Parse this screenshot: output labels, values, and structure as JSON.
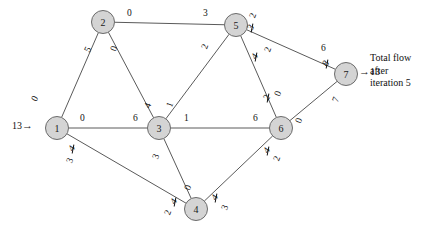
{
  "figure": {
    "type": "max-flow-network",
    "caption_lines": [
      "Total flow",
      "after",
      "iteration 5"
    ],
    "source_inflow": "13",
    "sink_outflow": "13",
    "source_arrow": "→",
    "sink_arrow": "→"
  },
  "nodes": [
    {
      "id": "1",
      "label": "1",
      "x": 57,
      "y": 128
    },
    {
      "id": "2",
      "label": "2",
      "x": 103,
      "y": 22
    },
    {
      "id": "3",
      "label": "3",
      "x": 159,
      "y": 128
    },
    {
      "id": "4",
      "label": "4",
      "x": 196,
      "y": 209
    },
    {
      "id": "5",
      "label": "5",
      "x": 236,
      "y": 25
    },
    {
      "id": "6",
      "label": "6",
      "x": 281,
      "y": 128
    },
    {
      "id": "7",
      "label": "7",
      "x": 346,
      "y": 74
    }
  ],
  "edges": [
    {
      "from": "1",
      "to": "2",
      "name": "edge-1-2"
    },
    {
      "from": "1",
      "to": "3",
      "name": "edge-1-3"
    },
    {
      "from": "1",
      "to": "4",
      "name": "edge-1-4"
    },
    {
      "from": "2",
      "to": "5",
      "name": "edge-2-5"
    },
    {
      "from": "2",
      "to": "3",
      "name": "edge-2-3"
    },
    {
      "from": "3",
      "to": "5",
      "name": "edge-3-5"
    },
    {
      "from": "3",
      "to": "6",
      "name": "edge-3-6"
    },
    {
      "from": "3",
      "to": "4",
      "name": "edge-3-4"
    },
    {
      "from": "5",
      "to": "6",
      "name": "edge-5-6"
    },
    {
      "from": "5",
      "to": "7",
      "name": "edge-5-7"
    },
    {
      "from": "4",
      "to": "6",
      "name": "edge-4-6"
    },
    {
      "from": "6",
      "to": "7",
      "name": "edge-6-7"
    }
  ],
  "edge_labels": {
    "e12_at1": {
      "text": "0",
      "x": 33,
      "y": 94,
      "rot": -62
    },
    "e12_at2": {
      "text": "5",
      "x": 86,
      "y": 45,
      "rot": -62
    },
    "e23_at2": {
      "text": "0",
      "x": 112,
      "y": 44,
      "rot": -70
    },
    "e23_at3": {
      "text": "4",
      "x": 146,
      "y": 101,
      "rot": -70
    },
    "e25_at2": {
      "text": "0",
      "x": 127,
      "y": 9,
      "rot": 0
    },
    "e25_at5": {
      "text": "3",
      "x": 203,
      "y": 9,
      "rot": 0
    },
    "e13_at1": {
      "text": "0",
      "x": 80,
      "y": 114,
      "rot": 0
    },
    "e13_at3": {
      "text": "6",
      "x": 133,
      "y": 114,
      "rot": 0
    },
    "e35_at3": {
      "text": "1",
      "x": 168,
      "y": 100,
      "rot": -70
    },
    "e35_at5": {
      "text": "2",
      "x": 203,
      "y": 42,
      "rot": -70
    },
    "e36_at3": {
      "text": "1",
      "x": 184,
      "y": 114,
      "rot": 0
    },
    "e36_at6": {
      "text": "6",
      "x": 253,
      "y": 114,
      "rot": 0
    },
    "e34_at3": {
      "text": "3",
      "x": 154,
      "y": 152,
      "rot": -70
    },
    "e34_at4": {
      "text": "0",
      "x": 186,
      "y": 183,
      "rot": -70
    },
    "e14_at1_old": {
      "text": "4",
      "x": 70,
      "y": 144,
      "rot": -55
    },
    "e14_at1_new": {
      "text": "3",
      "x": 68,
      "y": 156,
      "rot": -70
    },
    "e14_at4_old": {
      "text": "4",
      "x": 172,
      "y": 197,
      "rot": -55
    },
    "e14_at4_new": {
      "text": "2",
      "x": 166,
      "y": 208,
      "rot": -70
    },
    "e56_at5_old": {
      "text": "3",
      "x": 249,
      "y": 23,
      "rot": -55
    },
    "e56_at5_new": {
      "text": "2",
      "x": 251,
      "y": 11,
      "rot": -70
    },
    "e56_at6_old": {
      "text": "2",
      "x": 265,
      "y": 93,
      "rot": -55
    },
    "e56_at6_new": {
      "text": "0",
      "x": 276,
      "y": 89,
      "rot": -70
    },
    "e57_at5_old": {
      "text": "4",
      "x": 253,
      "y": 52,
      "rot": -55
    },
    "e57_at5_new": {
      "text": "2",
      "x": 266,
      "y": 45,
      "rot": -70
    },
    "e57_at7_old": {
      "text": "8",
      "x": 324,
      "y": 59,
      "rot": -55
    },
    "e57_at7_new": {
      "text": "6",
      "x": 321,
      "y": 44,
      "rot": 0
    },
    "e46_at4_old": {
      "text": "4",
      "x": 213,
      "y": 193,
      "rot": -55
    },
    "e46_at4_new": {
      "text": "3",
      "x": 223,
      "y": 203,
      "rot": -70
    },
    "e46_at6_old": {
      "text": "4",
      "x": 265,
      "y": 146,
      "rot": -55
    },
    "e46_at6_new": {
      "text": "2",
      "x": 275,
      "y": 154,
      "rot": -70
    },
    "e67_at6": {
      "text": "0",
      "x": 297,
      "y": 116,
      "rot": -70
    },
    "e67_at7": {
      "text": "7",
      "x": 334,
      "y": 95,
      "rot": -70
    }
  }
}
